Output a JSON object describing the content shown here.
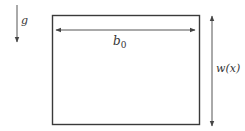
{
  "diagram": {
    "gravity": {
      "label": "g"
    },
    "width_arrow": {
      "label": "b",
      "subscript": "0"
    },
    "height_arrow": {
      "label": "w(x)"
    },
    "colors": {
      "stroke": "#3a3a3a",
      "arrow": "#555555",
      "text": "#333333"
    }
  }
}
